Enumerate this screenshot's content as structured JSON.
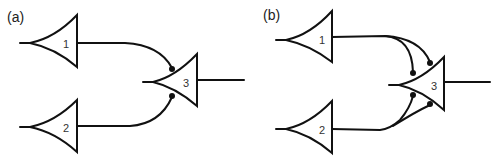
{
  "diagram": {
    "type": "neural-circuit",
    "colors": {
      "stroke": "#111111",
      "background": "#ffffff",
      "text": "#333333"
    },
    "panels": [
      {
        "id": "a",
        "label": "(a)",
        "neurons": [
          {
            "id": "1",
            "label": "1"
          },
          {
            "id": "2",
            "label": "2"
          },
          {
            "id": "3",
            "label": "3"
          }
        ],
        "connections": [
          {
            "from": "1",
            "to": "3",
            "synapses": 1
          },
          {
            "from": "2",
            "to": "3",
            "synapses": 1
          }
        ]
      },
      {
        "id": "b",
        "label": "(b)",
        "neurons": [
          {
            "id": "1",
            "label": "1"
          },
          {
            "id": "2",
            "label": "2"
          },
          {
            "id": "3",
            "label": "3"
          }
        ],
        "connections": [
          {
            "from": "1",
            "to": "3",
            "synapses": 2
          },
          {
            "from": "2",
            "to": "3",
            "synapses": 2
          }
        ]
      }
    ]
  }
}
